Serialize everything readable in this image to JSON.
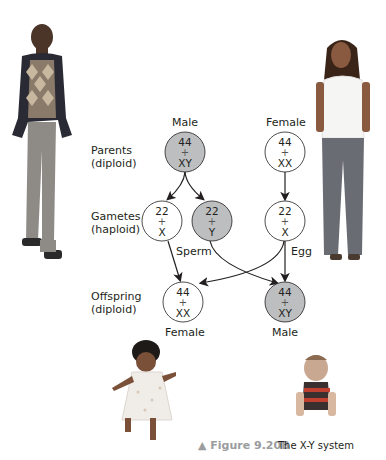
{
  "labels": {
    "male_parent": "Male",
    "female_parent": "Female",
    "parents": [
      "Parents",
      "(diploid)"
    ],
    "gametes": [
      "Gametes",
      "(haploid)"
    ],
    "offspring": [
      "Offspring",
      "(diploid)"
    ],
    "sperm": "Sperm",
    "egg": "Egg",
    "female_offspring": "Female",
    "male_offspring": "Male"
  },
  "nodes": {
    "male_parent": {
      "top": "44",
      "plus": "+",
      "bottom": "XY",
      "fill": "#bcbec0"
    },
    "female_parent": {
      "top": "44",
      "plus": "+",
      "bottom": "XX",
      "fill": "#ffffff"
    },
    "sperm_x": {
      "top": "22",
      "plus": "+",
      "bottom": "X",
      "fill": "#ffffff"
    },
    "sperm_y": {
      "top": "22",
      "plus": "+",
      "bottom": "Y",
      "fill": "#bcbec0"
    },
    "egg_x": {
      "top": "22",
      "plus": "+",
      "bottom": "X",
      "fill": "#ffffff"
    },
    "offspring_female": {
      "top": "44",
      "plus": "+",
      "bottom": "XX",
      "fill": "#ffffff"
    },
    "offspring_male": {
      "top": "44",
      "plus": "+",
      "bottom": "XY",
      "fill": "#bcbec0"
    }
  },
  "caption": {
    "figure": "▲ Figure 9.20B",
    "title": "The X-Y system"
  },
  "photos": [
    "adult-man",
    "adult-woman",
    "baby-girl",
    "baby-boy"
  ]
}
